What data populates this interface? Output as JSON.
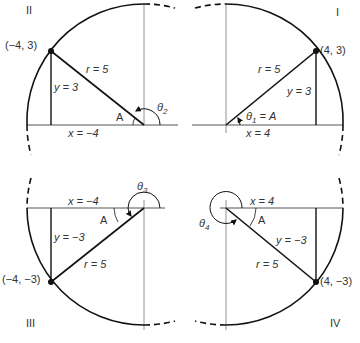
{
  "figure": {
    "quadrants": [
      {
        "id": "I",
        "roman_label": "I",
        "point_label": "(4, 3)",
        "r_label": "r = 5",
        "y_label": "y = 3",
        "x_label": "x = 4",
        "angle_label": "θ1 = A",
        "theta_sub": "1",
        "ref_angle_label": ""
      },
      {
        "id": "II",
        "roman_label": "II",
        "point_label": "(−4, 3)",
        "r_label": "r = 5",
        "y_label": "y = 3",
        "x_label": "x = −4",
        "angle_label": "θ2",
        "theta_sub": "2",
        "ref_angle_label": "A"
      },
      {
        "id": "III",
        "roman_label": "III",
        "point_label": "(−4, −3)",
        "r_label": "r = 5",
        "y_label": "y = −3",
        "x_label": "x = −4",
        "angle_label": "θ3",
        "theta_sub": "3",
        "ref_angle_label": "A"
      },
      {
        "id": "IV",
        "roman_label": "IV",
        "point_label": "(4, −3)",
        "r_label": "r = 5",
        "y_label": "y = −3",
        "x_label": "x = 4",
        "angle_label": "θ4",
        "theta_sub": "4",
        "ref_angle_label": "A"
      }
    ]
  },
  "text": {
    "q1": {
      "roman": "I",
      "point": "(4, 3)",
      "r": "r = 5",
      "y": "y = 3",
      "x": "x = 4",
      "theta": "θ",
      "sub": "1",
      "eqA": " = A"
    },
    "q2": {
      "roman": "II",
      "point": "(−4, 3)",
      "r": "r = 5",
      "y": "y = 3",
      "x": "x = −4",
      "theta": "θ",
      "sub": "2",
      "A": "A"
    },
    "q3": {
      "roman": "III",
      "point": "(−4, −3)",
      "r": "r = 5",
      "y": "y = −3",
      "x": "x = −4",
      "theta": "θ",
      "sub": "3",
      "A": "A"
    },
    "q4": {
      "roman": "IV",
      "point": "(4, −3)",
      "r": "r = 5",
      "y": "y = −3",
      "x": "x = 4",
      "theta": "θ",
      "sub": "4",
      "A": "A"
    }
  },
  "colors": {
    "stroke": "#111111",
    "thin": "#555555",
    "text": "#333333"
  }
}
